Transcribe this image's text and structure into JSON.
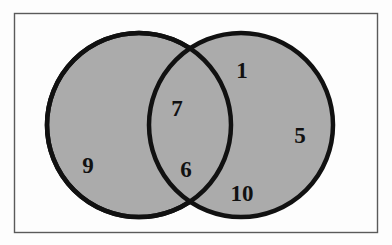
{
  "figure": {
    "type": "venn-diagram",
    "sets": 2,
    "frame": {
      "x": 14,
      "y": 13,
      "width": 364,
      "height": 220,
      "border_color": "#5a5a5a",
      "background_color": "#fdfdfd"
    },
    "style": {
      "circle_fill": "#ababab",
      "circle_stroke": "#111111",
      "circle_stroke_width": 4.5,
      "label_color": "#111111"
    },
    "circles": [
      {
        "name": "left-circle",
        "cx": 139,
        "cy": 125,
        "r": 92
      },
      {
        "name": "right-circle",
        "cx": 241,
        "cy": 125,
        "r": 92
      }
    ]
  },
  "chart_data": {
    "type": "venn",
    "title": "",
    "regions": [
      {
        "id": "left-only",
        "label": "9",
        "x": 88,
        "y": 165,
        "region": "A only"
      },
      {
        "id": "intersection-upper",
        "label": "7",
        "x": 177,
        "y": 108,
        "region": "A and B"
      },
      {
        "id": "intersection-lower",
        "label": "6",
        "x": 186,
        "y": 169,
        "region": "A and B"
      },
      {
        "id": "right-only-upper",
        "label": "1",
        "x": 242,
        "y": 70,
        "region": "B only"
      },
      {
        "id": "right-only-right",
        "label": "5",
        "x": 300,
        "y": 135,
        "region": "B only"
      },
      {
        "id": "right-only-lower",
        "label": "10",
        "x": 242,
        "y": 193,
        "region": "B only"
      }
    ],
    "values": [
      9,
      7,
      6,
      1,
      5,
      10
    ],
    "categories": [
      "9",
      "7",
      "6",
      "1",
      "5",
      "10"
    ],
    "legend": [],
    "xlabel": "",
    "ylabel": ""
  }
}
